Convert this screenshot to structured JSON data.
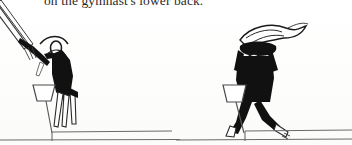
{
  "page": {
    "width": 352,
    "height": 145,
    "background_color": "#ffffff",
    "ink_color": "#111111",
    "line_color": "#5a5a5a",
    "text_color": "#2b2b2b"
  },
  "caption": {
    "text": "on the gymnast's lower back.",
    "clipped_at_top": true
  },
  "illustration": {
    "title": "Spotting a dismount from the uneven bars",
    "panel_count": 2,
    "panels": [
      {
        "id": "panel-left",
        "label": "gymnast hanging from bar with spotter reaching",
        "elements": [
          {
            "name": "uneven-bar",
            "label": "diagonal bar rail"
          },
          {
            "name": "spotter-figure",
            "label": "spotter with raised arm"
          },
          {
            "name": "gymnast-figure",
            "label": "gymnast in swing position"
          },
          {
            "name": "bar-stand",
            "label": "trapezoid bar base on post"
          },
          {
            "name": "platform-edge",
            "label": "raised mat platform"
          },
          {
            "name": "floor-line",
            "label": "floor line"
          }
        ]
      },
      {
        "id": "panel-right",
        "label": "gymnast standing with arms raised after landing",
        "elements": [
          {
            "name": "gymnast-figure",
            "label": "gymnast standing, arms overhead, hair flowing"
          },
          {
            "name": "bar-stand",
            "label": "trapezoid bar base on post"
          },
          {
            "name": "platform-edge",
            "label": "raised mat platform"
          },
          {
            "name": "floor-line",
            "label": "floor line"
          }
        ]
      }
    ]
  }
}
